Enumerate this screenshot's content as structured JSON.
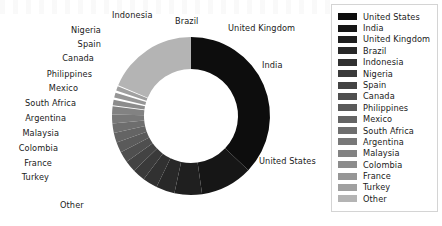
{
  "chart_data": {
    "type": "pie",
    "variant": "donut",
    "title": "",
    "subtitle": "",
    "xlabel": "",
    "ylabel": "",
    "grid": false,
    "legend_position": "right",
    "start_angle_deg": -90,
    "direction": "clockwise",
    "inner_radius_ratio": 0.6,
    "categories": [
      "United States",
      "India",
      "United Kingdom",
      "Brazil",
      "Indonesia",
      "Nigeria",
      "Spain",
      "Canada",
      "Philippines",
      "Mexico",
      "South Africa",
      "Argentina",
      "Malaysia",
      "Colombia",
      "France",
      "Turkey",
      "Other"
    ],
    "values": [
      33.0,
      9.5,
      5.0,
      3.4,
      2.7,
      2.3,
      2.1,
      2.0,
      1.9,
      1.8,
      1.7,
      1.6,
      1.5,
      1.4,
      1.3,
      1.2,
      16.6
    ],
    "colors": [
      "#0d0d0d",
      "#161616",
      "#1f1f1f",
      "#282828",
      "#313131",
      "#3a3a3a",
      "#434343",
      "#4f4f4f",
      "#5a5a5a",
      "#646464",
      "#6e6e6e",
      "#787878",
      "#828282",
      "#8c8c8c",
      "#969696",
      "#a0a0a0",
      "#b4b4b4"
    ],
    "explode_gap_deg": 1.6,
    "labels_shown": [
      "United States",
      "India",
      "United Kingdom",
      "Brazil",
      "Indonesia",
      "Nigeria",
      "Spain",
      "Canada",
      "Philippines",
      "Mexico",
      "South Africa",
      "Argentina",
      "Malaysia",
      "Colombia",
      "France",
      "Turkey",
      "Other"
    ]
  },
  "slice_labels": [
    {
      "text": "Indonesia",
      "x": 112,
      "y": 11,
      "align": "left"
    },
    {
      "text": "Brazil",
      "x": 175,
      "y": 17,
      "align": "left"
    },
    {
      "text": "United Kingdom",
      "x": 228,
      "y": 24,
      "align": "left"
    },
    {
      "text": "India",
      "x": 262,
      "y": 61,
      "align": "left"
    },
    {
      "text": "United States",
      "x": 259,
      "y": 157,
      "align": "left"
    },
    {
      "text": "Nigeria",
      "x": 101,
      "y": 26,
      "align": "right"
    },
    {
      "text": "Spain",
      "x": 101,
      "y": 40,
      "align": "right"
    },
    {
      "text": "Canada",
      "x": 94,
      "y": 54,
      "align": "right"
    },
    {
      "text": "Philippines",
      "x": 92,
      "y": 70,
      "align": "right"
    },
    {
      "text": "Mexico",
      "x": 78,
      "y": 84,
      "align": "right"
    },
    {
      "text": "South Africa",
      "x": 76,
      "y": 99,
      "align": "right"
    },
    {
      "text": "Argentina",
      "x": 66,
      "y": 114,
      "align": "right"
    },
    {
      "text": "Malaysia",
      "x": 59,
      "y": 129,
      "align": "right"
    },
    {
      "text": "Colombia",
      "x": 58,
      "y": 144,
      "align": "right"
    },
    {
      "text": "France",
      "x": 52,
      "y": 159,
      "align": "right"
    },
    {
      "text": "Turkey",
      "x": 49,
      "y": 173,
      "align": "right"
    },
    {
      "text": "Other",
      "x": 60,
      "y": 201,
      "align": "left"
    }
  ],
  "legend": {
    "items": [
      {
        "label": "United States",
        "color": "#0d0d0d"
      },
      {
        "label": "India",
        "color": "#161616"
      },
      {
        "label": "United Kingdom",
        "color": "#1f1f1f"
      },
      {
        "label": "Brazil",
        "color": "#282828"
      },
      {
        "label": "Indonesia",
        "color": "#313131"
      },
      {
        "label": "Nigeria",
        "color": "#3a3a3a"
      },
      {
        "label": "Spain",
        "color": "#434343"
      },
      {
        "label": "Canada",
        "color": "#4f4f4f"
      },
      {
        "label": "Philippines",
        "color": "#5a5a5a"
      },
      {
        "label": "Mexico",
        "color": "#646464"
      },
      {
        "label": "South Africa",
        "color": "#6e6e6e"
      },
      {
        "label": "Argentina",
        "color": "#787878"
      },
      {
        "label": "Malaysia",
        "color": "#828282"
      },
      {
        "label": "Colombia",
        "color": "#8c8c8c"
      },
      {
        "label": "France",
        "color": "#969696"
      },
      {
        "label": "Turkey",
        "color": "#a0a0a0"
      },
      {
        "label": "Other",
        "color": "#b4b4b4"
      }
    ]
  },
  "geometry": {
    "center_x": 191,
    "center_y": 116,
    "outer_radius": 79,
    "inner_radius": 47
  }
}
